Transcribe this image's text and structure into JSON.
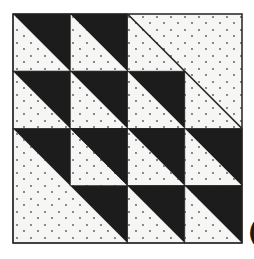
{
  "diagram": {
    "title": "",
    "type": "quilt-block",
    "grid": {
      "rows": 4,
      "cols": 4,
      "origin": [
        13,
        14
      ],
      "cell": 57.25
    },
    "colors": {
      "dark": "#1c1c1c",
      "light": "#f6f6f4",
      "dot": "#555555",
      "line": "#222222"
    },
    "cells": [
      {
        "row": 0,
        "col": 0,
        "kind": "hst"
      },
      {
        "row": 0,
        "col": 1,
        "kind": "hst"
      },
      {
        "row": 1,
        "col": 0,
        "kind": "hst"
      },
      {
        "row": 1,
        "col": 1,
        "kind": "hst"
      },
      {
        "row": 1,
        "col": 2,
        "kind": "hst"
      },
      {
        "row": 2,
        "col": 1,
        "kind": "hst"
      },
      {
        "row": 2,
        "col": 2,
        "kind": "hst"
      },
      {
        "row": 2,
        "col": 3,
        "kind": "hst"
      },
      {
        "row": 3,
        "col": 2,
        "kind": "hst"
      },
      {
        "row": 3,
        "col": 3,
        "kind": "hst"
      }
    ],
    "large_pieces": [
      {
        "name": "top-right-light-square",
        "row": 0,
        "col": 2,
        "span": 2,
        "kind": "light-with-diagonal-line"
      },
      {
        "name": "bottom-left-large-hst",
        "row": 2,
        "col": 0,
        "span": 2,
        "kind": "large-hst"
      }
    ],
    "edge_glyph": "("
  }
}
